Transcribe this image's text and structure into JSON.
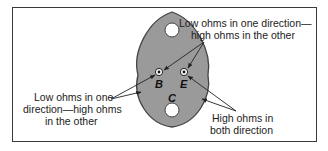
{
  "diagram": {
    "terminals": {
      "base": "B",
      "emitter": "E",
      "collector": "C"
    },
    "annotations": {
      "top_right": {
        "line1": "Low ohms in one direction—",
        "line2": "high ohms in the other"
      },
      "left": {
        "line1": "Low ohms in one",
        "line2": "direction—high ohms",
        "line3": "in the other"
      },
      "bottom_right": {
        "line1": "High ohms in",
        "line2": "both direction"
      }
    },
    "colors": {
      "case_fill": "#9a9a9a",
      "case_stroke": "#444444",
      "border": "#3a3a3a",
      "text": "#222222"
    }
  }
}
